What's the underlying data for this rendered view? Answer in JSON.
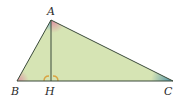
{
  "diagram": {
    "type": "right-triangle-altitude",
    "vertices": {
      "A": {
        "label": "A",
        "x": 51,
        "y": 20
      },
      "B": {
        "label": "B",
        "x": 17,
        "y": 81
      },
      "C": {
        "label": "C",
        "x": 173,
        "y": 81
      },
      "H": {
        "label": "H",
        "x": 51,
        "y": 81
      }
    },
    "segments": [
      "AB",
      "AC",
      "BC",
      "AH"
    ],
    "right_angle_marks": [
      "AHB",
      "AHC"
    ],
    "colors": {
      "fill": "#d6e4b4",
      "stroke": "#3a4a3a",
      "angle_A_left": "#6aa9c9",
      "angle_A_right": "#e08aa0",
      "angle_B": "#e08aa0",
      "angle_C": "#3f8aa8",
      "right_angle": "#d9a441"
    }
  }
}
